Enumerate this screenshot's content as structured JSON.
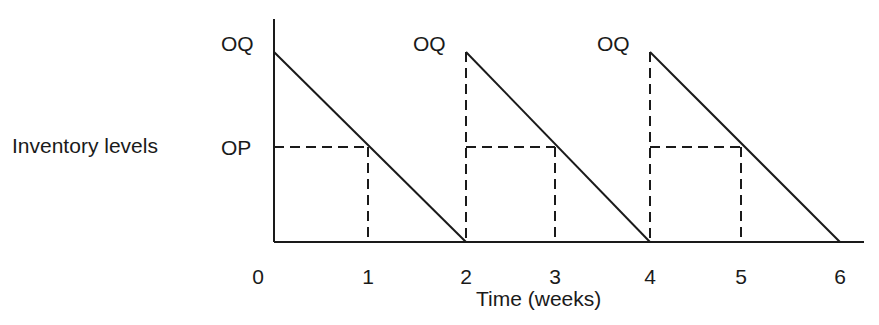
{
  "chart_data": {
    "type": "line",
    "title": "",
    "xlabel": "Time (weeks)",
    "ylabel": "Inventory levels",
    "x_ticks": [
      "0",
      "1",
      "2",
      "3",
      "4",
      "5",
      "6"
    ],
    "xlim": [
      0,
      6
    ],
    "y_levels": [
      {
        "name": "OQ",
        "label": "OQ",
        "value": 1.0
      },
      {
        "name": "OP",
        "label": "OP",
        "value": 0.5
      }
    ],
    "ylim": [
      0,
      1.2
    ],
    "grid": false,
    "legend": "none",
    "series": [
      {
        "name": "inventory",
        "style": "solid",
        "points": [
          [
            0,
            1.0
          ],
          [
            2,
            0
          ],
          [
            2,
            1.0
          ],
          [
            4,
            0
          ],
          [
            4,
            1.0
          ],
          [
            6,
            0
          ]
        ]
      }
    ],
    "cycles": [
      {
        "order_at": 0,
        "reorder_at": 1,
        "stockout_at": 2,
        "oq_label": "OQ",
        "op_label": "OP"
      },
      {
        "order_at": 2,
        "reorder_at": 3,
        "stockout_at": 4,
        "oq_label": "OQ",
        "op_label": ""
      },
      {
        "order_at": 4,
        "reorder_at": 5,
        "stockout_at": 6,
        "oq_label": "OQ",
        "op_label": ""
      }
    ]
  }
}
